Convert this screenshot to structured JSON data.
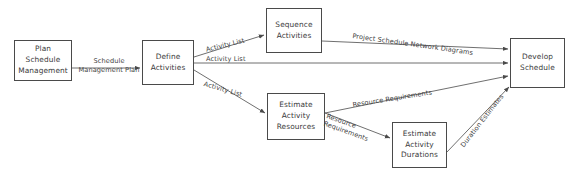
{
  "diagram": {
    "type": "flow-diagram",
    "stroke_color": "#4a4a4a",
    "text_color": "#3a3a3a",
    "background": "#ffffff",
    "nodes": [
      {
        "id": "plan-schedule-management",
        "label": "Plan\nSchedule\nManagement",
        "x": 14,
        "y": 40,
        "w": 58,
        "h": 41
      },
      {
        "id": "define-activities",
        "label": "Define\nActivities",
        "x": 142,
        "y": 40,
        "w": 52,
        "h": 45
      },
      {
        "id": "sequence-activities",
        "label": "Sequence\nActivities",
        "x": 266,
        "y": 8,
        "w": 56,
        "h": 45
      },
      {
        "id": "estimate-activity-resources",
        "label": "Estimate\nActivity\nResources",
        "x": 267,
        "y": 93,
        "w": 58,
        "h": 47
      },
      {
        "id": "estimate-activity-durations",
        "label": "Estimate\nActivity\nDurations",
        "x": 392,
        "y": 122,
        "w": 55,
        "h": 46
      },
      {
        "id": "develop-schedule",
        "label": "Develop\nSchedule",
        "x": 510,
        "y": 38,
        "w": 55,
        "h": 50
      }
    ],
    "edge_labels": [
      {
        "id": "schedule-management-plan",
        "text": "Schedule\nManagement Plan",
        "x": 76,
        "y": 57,
        "rotate": 0,
        "align": "center"
      },
      {
        "id": "activity-list-to-sequence",
        "text": "Activity List",
        "x": 205,
        "y": 46,
        "rotate": -14,
        "align": "left"
      },
      {
        "id": "activity-list-to-develop",
        "text": "Activity List",
        "x": 206,
        "y": 61,
        "rotate": 0,
        "align": "left"
      },
      {
        "id": "activity-list-to-estimate-resources",
        "text": "Activity List",
        "x": 205,
        "y": 80,
        "rotate": 16,
        "align": "left"
      },
      {
        "id": "project-schedule-network-diagrams",
        "text": "Project Schedule Network Diagrams",
        "x": 353,
        "y": 44,
        "rotate": 8,
        "align": "left"
      },
      {
        "id": "resource-requirements-to-develop",
        "text": "Resource Requirements",
        "x": 352,
        "y": 101,
        "rotate": -9,
        "align": "left"
      },
      {
        "id": "resource-requirements-to-durations",
        "text": "Resource\nRequirements",
        "x": 328,
        "y": 112,
        "rotate": 20,
        "align": "left"
      },
      {
        "id": "duration-estimates",
        "text": "Duration Estimates",
        "x": 459,
        "y": 144,
        "rotate": -52,
        "align": "left"
      }
    ],
    "edges": [
      {
        "id": "edge-plan-to-define",
        "from": "plan-schedule-management",
        "to": "define-activities",
        "label": "Schedule Management Plan"
      },
      {
        "id": "edge-define-to-sequence",
        "from": "define-activities",
        "to": "sequence-activities",
        "label": "Activity List"
      },
      {
        "id": "edge-define-to-develop",
        "from": "define-activities",
        "to": "develop-schedule",
        "label": "Activity List"
      },
      {
        "id": "edge-define-to-estimate-resources",
        "from": "define-activities",
        "to": "estimate-activity-resources",
        "label": "Activity List"
      },
      {
        "id": "edge-sequence-to-develop",
        "from": "sequence-activities",
        "to": "develop-schedule",
        "label": "Project Schedule Network Diagrams"
      },
      {
        "id": "edge-resources-to-develop",
        "from": "estimate-activity-resources",
        "to": "develop-schedule",
        "label": "Resource Requirements"
      },
      {
        "id": "edge-resources-to-durations",
        "from": "estimate-activity-resources",
        "to": "estimate-activity-durations",
        "label": "Resource Requirements"
      },
      {
        "id": "edge-durations-to-develop",
        "from": "estimate-activity-durations",
        "to": "develop-schedule",
        "label": "Duration Estimates"
      }
    ]
  }
}
